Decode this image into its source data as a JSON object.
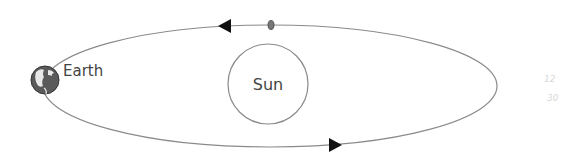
{
  "diagram": {
    "labels": {
      "earth": "Earth",
      "sun": "Sun",
      "faint_top": "12",
      "faint_bottom": "30"
    },
    "colors": {
      "orbit": "#8a8a8a",
      "sun_outline": "#8a8a8a",
      "arrow": "#111111",
      "text": "#444444",
      "earth": "#555555"
    },
    "elements": [
      {
        "type": "orbit-ellipse",
        "cx": 270,
        "cy": 86,
        "rx": 227,
        "ry": 61
      },
      {
        "type": "sun-circle",
        "cx": 268,
        "cy": 84,
        "r": 40
      },
      {
        "type": "earth-globe",
        "cx": 45,
        "cy": 80,
        "r": 14
      },
      {
        "type": "direction-arrow-top",
        "x": 225,
        "y": 26,
        "direction": "left"
      },
      {
        "type": "direction-arrow-bottom",
        "x": 335,
        "y": 145,
        "direction": "right"
      },
      {
        "type": "small-body-top",
        "x": 271,
        "y": 25
      }
    ]
  }
}
